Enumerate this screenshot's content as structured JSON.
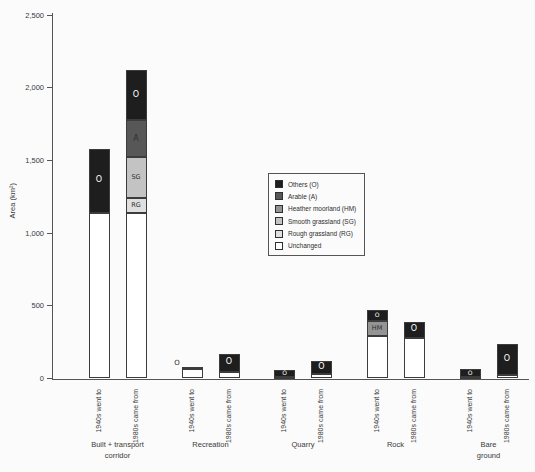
{
  "page": {
    "background": "#fbfbfb"
  },
  "chart_data": {
    "type": "bar",
    "stacked": true,
    "title": "",
    "ylabel": "Area (km²)",
    "xlabel": "",
    "ylim": [
      0,
      2500
    ],
    "grid": false,
    "legend_position": "center-right",
    "colors": {
      "axis": "#555555",
      "text": "#3a3a3a",
      "bar_border": "#3c3c3c",
      "label_on_dark": "#ffffff",
      "label_on_light": "#2e2e2e"
    },
    "yticks": [
      {
        "value": 0,
        "label": "0"
      },
      {
        "value": 500,
        "label": "500"
      },
      {
        "value": 1000,
        "label": "1,000"
      },
      {
        "value": 1500,
        "label": "1,500"
      },
      {
        "value": 2000,
        "label": "2,000"
      },
      {
        "value": 2500,
        "label": "2,500"
      }
    ],
    "segments": [
      {
        "key": "O",
        "label": "Others (O)",
        "color": "#1e1e1e"
      },
      {
        "key": "A",
        "label": "Arable (A)",
        "color": "#575757"
      },
      {
        "key": "HM",
        "label": "Heather moorland (HM)",
        "color": "#949494"
      },
      {
        "key": "SG",
        "label": "Smooth grassland (SG)",
        "color": "#c3c3c3"
      },
      {
        "key": "RG",
        "label": "Rough grassland (RG)",
        "color": "#dfdfdf"
      },
      {
        "key": "U",
        "label": "Unchanged",
        "color": "#ffffff"
      }
    ],
    "series_labels": [
      "1940s went to",
      "1980s came from"
    ],
    "categories": [
      {
        "name": "Built + transport corridor",
        "display": "Built + transport\ncorridor"
      },
      {
        "name": "Recreation",
        "display": "Recreation"
      },
      {
        "name": "Quarry",
        "display": "Quarry"
      },
      {
        "name": "Rock",
        "display": "Rock"
      },
      {
        "name": "Bare ground",
        "display": "Bare\nground"
      }
    ],
    "bars": [
      {
        "category": "Built + transport corridor",
        "series": "1940s went to",
        "stack": [
          {
            "key": "U",
            "value": 1140
          },
          {
            "key": "O",
            "value": 440,
            "label": "O"
          }
        ]
      },
      {
        "category": "Built + transport corridor",
        "series": "1980s came from",
        "stack": [
          {
            "key": "U",
            "value": 1140
          },
          {
            "key": "RG",
            "value": 100,
            "label": "RG"
          },
          {
            "key": "SG",
            "value": 280,
            "label": "SG"
          },
          {
            "key": "A",
            "value": 255,
            "label": "A"
          },
          {
            "key": "O",
            "value": 345,
            "label": "O"
          }
        ]
      },
      {
        "category": "Recreation",
        "series": "1940s went to",
        "stack": [
          {
            "key": "U",
            "value": 65
          },
          {
            "key": "O",
            "value": 15,
            "label": "O",
            "label_outside": true
          }
        ]
      },
      {
        "category": "Recreation",
        "series": "1980s came from",
        "stack": [
          {
            "key": "U",
            "value": 45
          },
          {
            "key": "O",
            "value": 125,
            "label": "O"
          }
        ]
      },
      {
        "category": "Quarry",
        "series": "1940s went to",
        "stack": [
          {
            "key": "U",
            "value": 10
          },
          {
            "key": "O",
            "value": 50,
            "label": "O"
          }
        ]
      },
      {
        "category": "Quarry",
        "series": "1980s came from",
        "stack": [
          {
            "key": "U",
            "value": 30
          },
          {
            "key": "O",
            "value": 90,
            "label": "O"
          }
        ]
      },
      {
        "category": "Rock",
        "series": "1940s went to",
        "stack": [
          {
            "key": "U",
            "value": 290
          },
          {
            "key": "HM",
            "value": 105,
            "label": "HM"
          },
          {
            "key": "O",
            "value": 75,
            "label": "O"
          }
        ]
      },
      {
        "category": "Rock",
        "series": "1980s came from",
        "stack": [
          {
            "key": "U",
            "value": 280
          },
          {
            "key": "O",
            "value": 110,
            "label": "O"
          }
        ]
      },
      {
        "category": "Bare ground",
        "series": "1940s went to",
        "stack": [
          {
            "key": "U",
            "value": 10
          },
          {
            "key": "O",
            "value": 55,
            "label": "O"
          }
        ]
      },
      {
        "category": "Bare ground",
        "series": "1980s came from",
        "stack": [
          {
            "key": "U",
            "value": 25
          },
          {
            "key": "O",
            "value": 215,
            "label": "O"
          }
        ]
      }
    ]
  }
}
